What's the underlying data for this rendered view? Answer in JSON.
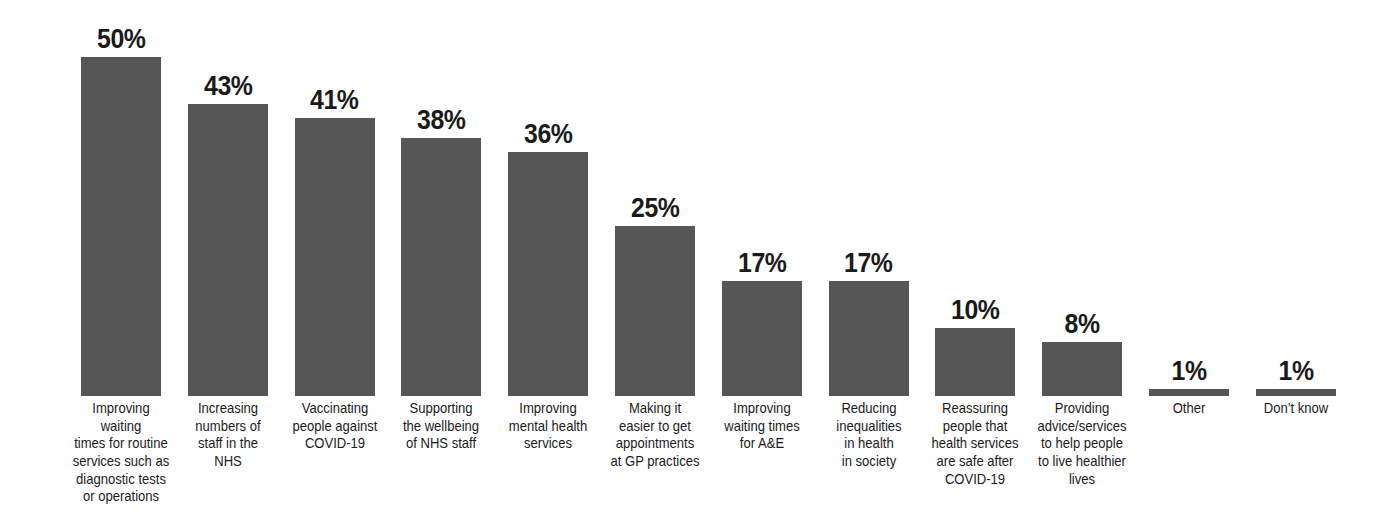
{
  "chart_data": {
    "type": "bar",
    "title": "",
    "subtitle": "",
    "xlabel": "",
    "ylabel": "",
    "ylim": [
      0,
      50
    ],
    "grid": false,
    "legend": false,
    "orientation": "vertical",
    "value_suffix": "%",
    "bar_color": "#565656",
    "background_color": "#ffffff",
    "label_color": "#1a1a1a",
    "categories": [
      "Improving waiting times for routine services such as diagnostic tests or operations",
      "Increasing numbers of staff in the NHS",
      "Vaccinating people against COVID-19",
      "Supporting the wellbeing of NHS staff",
      "Improving mental health services",
      "Making it easier to get appointments at GP practices",
      "Improving waiting times for A&E",
      "Reducing inequalities in health in society",
      "Reassuring people that health services are safe after COVID-19",
      "Providing advice/services to help people to live healthier lives",
      "Other",
      "Don’t know"
    ],
    "values": [
      50,
      43,
      41,
      38,
      36,
      25,
      17,
      17,
      10,
      8,
      1,
      1
    ],
    "value_labels": [
      "50%",
      "43%",
      "41%",
      "38%",
      "36%",
      "25%",
      "17%",
      "17%",
      "10%",
      "8%",
      "1%",
      "1%"
    ],
    "category_label_lines": [
      [
        "Improving waiting",
        "times for routine",
        "services such as",
        "diagnostic tests",
        "or operations"
      ],
      [
        "Increasing",
        "numbers of",
        "staff in the",
        "NHS"
      ],
      [
        "Vaccinating",
        "people against",
        "COVID-19"
      ],
      [
        "Supporting",
        "the wellbeing",
        "of NHS staff"
      ],
      [
        "Improving",
        "mental health",
        "services"
      ],
      [
        "Making it",
        "easier to get",
        "appointments",
        "at GP practices"
      ],
      [
        "Improving",
        "waiting times",
        "for A&E"
      ],
      [
        "Reducing",
        "inequalities",
        "in health",
        "in society"
      ],
      [
        "Reassuring",
        "people that",
        "health services",
        "are safe after",
        "COVID-19"
      ],
      [
        "Providing",
        "advice/services",
        "to help people",
        "to live healthier",
        "lives"
      ],
      [
        "Other"
      ],
      [
        "Don’t know"
      ]
    ]
  }
}
